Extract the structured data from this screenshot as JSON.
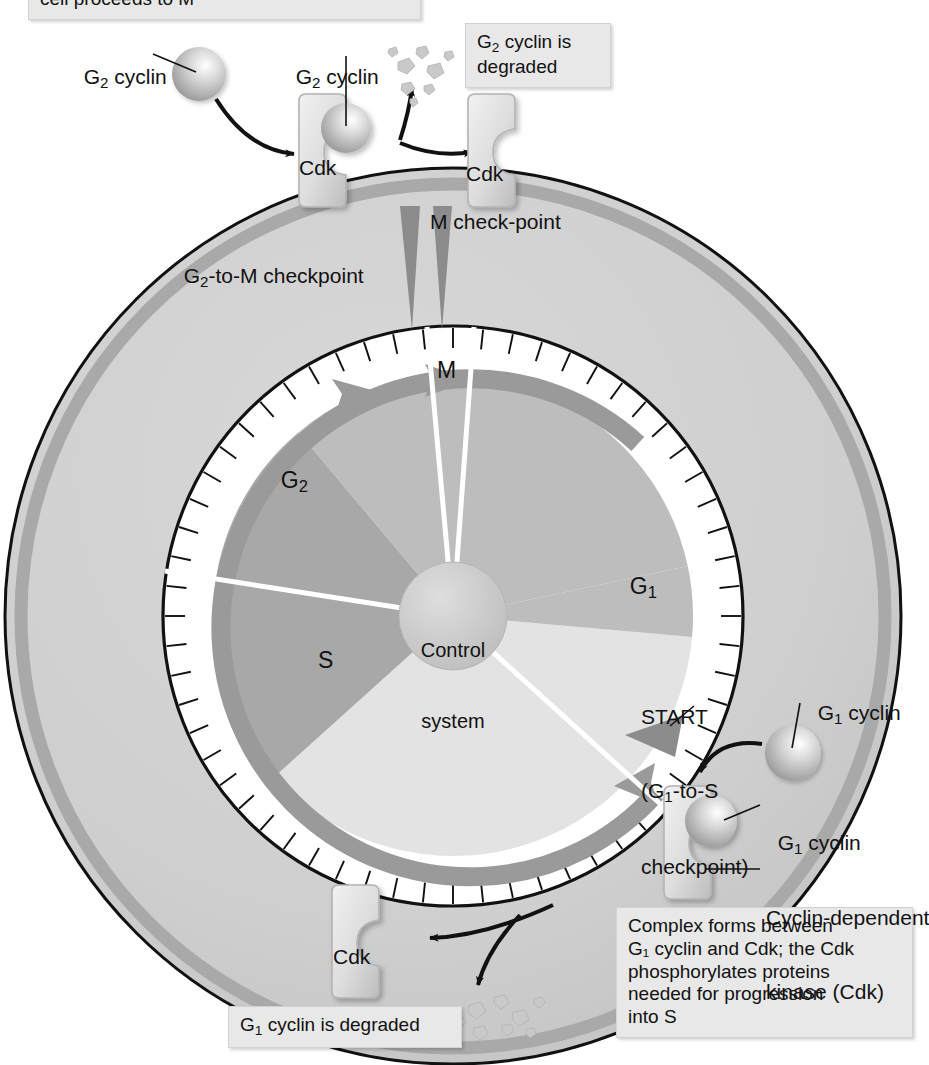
{
  "figure": {
    "type": "diagram"
  },
  "colors": {
    "cell_outline": "#111111",
    "cell_fill": "#cfcfcf",
    "cell_inner_ring": "#a9a9a9",
    "dial_face": "#ffffff",
    "dial_outline": "#111111",
    "tick": "#111111",
    "progress_arc": "#9a9a9a",
    "sector_g1": "#e3e3e3",
    "sector_g2": "#bdbdbd",
    "sector_s": "#a8a8a8",
    "sector_m": "#bdbdbd",
    "control_hub": "#c9c9c9",
    "marker": "#8c8c8c",
    "protein_fill": "#dedede",
    "protein_edge": "#b3b3b3",
    "cyclin_sphere": "#b9b9b9",
    "debris": "#c6c6c6",
    "callout_bg": "#e8e8e8",
    "arrow": "#111111"
  },
  "callouts": [
    {
      "id": "cell-proceeds",
      "text": "cell proceeds to M"
    },
    {
      "id": "g2-degraded",
      "line1": "G",
      "sub1": "2",
      "line1b": " cyclin is",
      "line2": "degraded"
    },
    {
      "id": "g1-degraded",
      "line1": "G",
      "sub1": "1",
      "line1b": " cyclin is degraded"
    },
    {
      "id": "complex-forms",
      "lines": [
        "Complex forms between",
        "G₁ cyclin and Cdk; the Cdk",
        "phosphorylates proteins",
        "needed for progression",
        "into S"
      ]
    }
  ],
  "labels": {
    "g2_cyclin_free": {
      "base": "G",
      "sub": "2",
      "rest": " cyclin"
    },
    "g2_cyclin_bound": {
      "base": "G",
      "sub": "2",
      "rest": " cyclin"
    },
    "g1_cyclin_free": {
      "base": "G",
      "sub": "1",
      "rest": " cyclin"
    },
    "g1_cyclin_bound": {
      "base": "G",
      "sub": "1",
      "rest": " cyclin"
    },
    "cdk_top_left": "Cdk",
    "cdk_top_right": "Cdk",
    "cdk_bottom": "Cdk",
    "cdk_g1_complex_l1": "Cyclin-dependent",
    "cdk_g1_complex_l2": "kinase (Cdk)",
    "g2_to_m_checkpoint": {
      "base": "G",
      "sub": "2",
      "rest": "-to-M checkpoint"
    },
    "m_checkpoint": "M check-point",
    "start_l1": "START",
    "start_l2": {
      "base": "(G",
      "sub": "1",
      "rest": "-to-S"
    },
    "start_l3": "checkpoint)",
    "control_system_l1": "Control",
    "control_system_l2": "system",
    "phase_g1": {
      "base": "G",
      "sub": "1"
    },
    "phase_g2": {
      "base": "G",
      "sub": "2"
    },
    "phase_s": "S",
    "phase_m": "M"
  },
  "chart_data": {
    "type": "pie",
    "categories": [
      "G1",
      "S",
      "G2",
      "M"
    ],
    "note": "clock-face dial with 60 minor tick marks around the rim",
    "tick_count": 60,
    "sectors": [
      {
        "name": "G1",
        "start_deg": 95,
        "end_deg": 228,
        "fill": "#e3e3e3"
      },
      {
        "name": "S",
        "start_deg": 228,
        "end_deg": 320,
        "fill": "#a8a8a8"
      },
      {
        "name": "G2",
        "start_deg": 320,
        "end_deg": 78,
        "fill": "#bdbdbd"
      },
      {
        "name": "M",
        "start_deg": 78,
        "end_deg": 95,
        "fill": "#bdbdbd"
      }
    ],
    "markers": [
      {
        "name": "G2-to-M checkpoint",
        "angle_deg": 84
      },
      {
        "name": "M check-point",
        "angle_deg": 95
      },
      {
        "name": "START (G1-to-S checkpoint)",
        "angle_deg": 228
      }
    ]
  }
}
